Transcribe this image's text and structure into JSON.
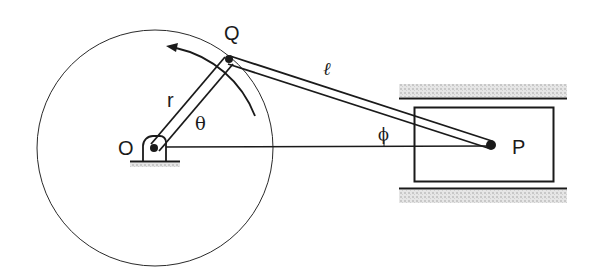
{
  "diagram": {
    "labels": {
      "pivot": "O",
      "crank_pin": "Q",
      "piston_pin": "P",
      "crank_length": "r",
      "rod_length": "ℓ",
      "crank_angle": "θ",
      "rod_angle": "ϕ"
    },
    "colors": {
      "stroke": "#1a1a1a",
      "hatch": "#d4d4d4",
      "background": "#ffffff"
    },
    "geometry": {
      "O": [
        155,
        148
      ],
      "Q": [
        229,
        60
      ],
      "P": [
        491,
        145
      ],
      "circle_radius": 118,
      "slider_box": {
        "x": 414,
        "y": 107,
        "w": 139,
        "h": 74
      },
      "guide_top_y": 98,
      "guide_bottom_y": 188,
      "guide_x": [
        399,
        567
      ]
    }
  }
}
